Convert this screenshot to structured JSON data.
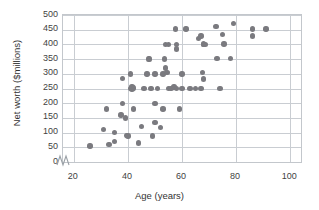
{
  "chart_data": {
    "type": "scatter",
    "title": "",
    "xlabel": "Age (years)",
    "ylabel": "Net worth ($millions)",
    "xlim": [
      16,
      104
    ],
    "ylim": [
      0,
      500
    ],
    "xticks": [
      20,
      40,
      60,
      80,
      100
    ],
    "yticks": [
      0,
      50,
      100,
      150,
      200,
      250,
      300,
      350,
      400,
      450,
      500
    ],
    "grid": true,
    "legend": null,
    "axis_break": "x-axis break near origin (zigzag)",
    "marker_color": "#7a7a7f",
    "points": [
      [
        26,
        55
      ],
      [
        31,
        110
      ],
      [
        32,
        180
      ],
      [
        33,
        60
      ],
      [
        35,
        70
      ],
      [
        35,
        100
      ],
      [
        37.5,
        160
      ],
      [
        38,
        200
      ],
      [
        38,
        285
      ],
      [
        39,
        150
      ],
      [
        39.5,
        90
      ],
      [
        40,
        88
      ],
      [
        41,
        300
      ],
      [
        41,
        250
      ],
      [
        41.5,
        255
      ],
      [
        41.5,
        248
      ],
      [
        42,
        252
      ],
      [
        42,
        180
      ],
      [
        44,
        65
      ],
      [
        45,
        120
      ],
      [
        46,
        250
      ],
      [
        47,
        300
      ],
      [
        47.5,
        350
      ],
      [
        48,
        350
      ],
      [
        48.5,
        250
      ],
      [
        49,
        88
      ],
      [
        50,
        135
      ],
      [
        50,
        200
      ],
      [
        50,
        300
      ],
      [
        51,
        250
      ],
      [
        52,
        117
      ],
      [
        53,
        180
      ],
      [
        53,
        300
      ],
      [
        53.5,
        350
      ],
      [
        54,
        320
      ],
      [
        54,
        400
      ],
      [
        54.5,
        305
      ],
      [
        55,
        400
      ],
      [
        55,
        250
      ],
      [
        56,
        250
      ],
      [
        57,
        255
      ],
      [
        57.5,
        452
      ],
      [
        58,
        250
      ],
      [
        58,
        385
      ],
      [
        58,
        400
      ],
      [
        59,
        180
      ],
      [
        60,
        300
      ],
      [
        60,
        250
      ],
      [
        61.5,
        452
      ],
      [
        63,
        250
      ],
      [
        65,
        250
      ],
      [
        67,
        250
      ],
      [
        67.5,
        305
      ],
      [
        68,
        282
      ],
      [
        68,
        400
      ],
      [
        68,
        402
      ],
      [
        68.5,
        400
      ],
      [
        66,
        420
      ],
      [
        67,
        428
      ],
      [
        72.5,
        461
      ],
      [
        73,
        352
      ],
      [
        74,
        250
      ],
      [
        75,
        433
      ],
      [
        75.5,
        402
      ],
      [
        78,
        352
      ],
      [
        79,
        472
      ],
      [
        86,
        452
      ],
      [
        86,
        428
      ],
      [
        91,
        452
      ]
    ]
  },
  "axis": {
    "y_title": "Net worth ($millions)",
    "x_title": "Age (years)"
  }
}
